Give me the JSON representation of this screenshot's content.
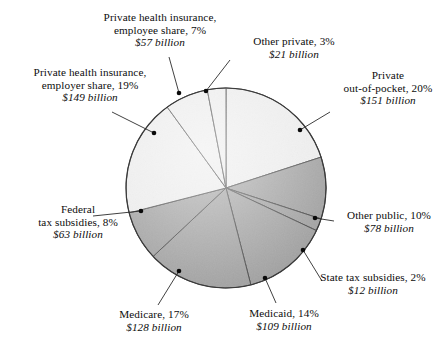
{
  "figure": {
    "type": "pie",
    "center": {
      "x": 226,
      "y": 188
    },
    "radius": 100,
    "colors": {
      "private_fill": "#ececec",
      "public_fill": "#9c9c9c",
      "outline": "#3a3a3a",
      "leader_line": "#2b2b2b",
      "dot": "#0a0a0a",
      "text": "#0d0d0d",
      "background": "#ffffff"
    }
  },
  "chart_data": {
    "type": "pie",
    "title": "",
    "unit": "billion dollars",
    "legend_position": "callout-labels",
    "total_percent": 100,
    "categories": [
      "Private health insurance, employee share",
      "Other private",
      "Private out-of-pocket",
      "Other public",
      "State tax subsidies",
      "Medicaid",
      "Medicare",
      "Federal tax subsidies"
    ],
    "values": [
      7,
      3,
      20,
      10,
      2,
      14,
      17,
      19
    ],
    "amounts": [
      57,
      21,
      151,
      78,
      12,
      109,
      128,
      149
    ],
    "slices": [
      {
        "name": "Private health insurance, employer share",
        "percent": 19,
        "amount": 149,
        "group": "private",
        "fill": "#ececec"
      },
      {
        "name": "Private health insurance, employee share",
        "percent": 7,
        "amount": 57,
        "group": "private",
        "fill": "#ececec"
      },
      {
        "name": "Other private",
        "percent": 3,
        "amount": 21,
        "group": "private",
        "fill": "#ececec"
      },
      {
        "name": "Private out-of-pocket",
        "percent": 20,
        "amount": 151,
        "group": "private",
        "fill": "#ececec"
      },
      {
        "name": "Other public",
        "percent": 10,
        "amount": 78,
        "group": "public",
        "fill": "#9c9c9c"
      },
      {
        "name": "State tax subsidies",
        "percent": 2,
        "amount": 12,
        "group": "public",
        "fill": "#9c9c9c"
      },
      {
        "name": "Medicaid",
        "percent": 14,
        "amount": 109,
        "group": "public",
        "fill": "#9c9c9c"
      },
      {
        "name": "Medicare",
        "percent": 17,
        "amount": 128,
        "group": "public",
        "fill": "#9c9c9c"
      },
      {
        "name": "Federal tax subsidies",
        "percent": 8,
        "amount": 63,
        "group": "public",
        "fill": "#9c9c9c"
      }
    ],
    "xlabel": "",
    "ylabel": ""
  },
  "labels": {
    "phi_employee": {
      "line1": "Private health insurance,",
      "line2": "employee share, 7%",
      "amount": "$57 billion"
    },
    "other_private": {
      "line1": "Other private, 3%",
      "line2": "",
      "amount": "$21 billion"
    },
    "phi_employer": {
      "line1": "Private health insurance,",
      "line2": "employer share, 19%",
      "amount": "$149 billion"
    },
    "private_oop": {
      "line1": "Private",
      "line2": "out-of-pocket, 20%",
      "amount": "$151 billion"
    },
    "federal_tax": {
      "line1": "Federal",
      "line2": "tax subsidies, 8%",
      "amount": "$63 billion"
    },
    "other_public": {
      "line1": "Other public, 10%",
      "line2": "",
      "amount": "$78 billion"
    },
    "state_tax": {
      "line1": "State tax subsidies, 2%",
      "line2": "",
      "amount": "$12 billion"
    },
    "medicare": {
      "line1": "Medicare, 17%",
      "line2": "",
      "amount": "$128 billion"
    },
    "medicaid": {
      "line1": "Medicaid, 14%",
      "line2": "",
      "amount": "$109 billion"
    }
  }
}
